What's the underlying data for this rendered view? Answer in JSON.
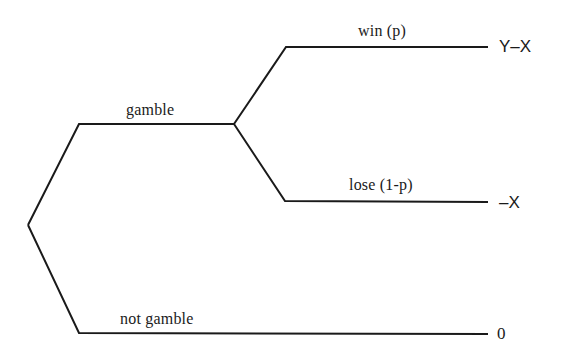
{
  "diagram": {
    "type": "decision-tree",
    "line_color": "#1a1a1a",
    "background": "#ffffff",
    "nodes": {
      "decision": {
        "x": 28,
        "y": 225
      },
      "chance": {
        "x": 234,
        "y": 125
      }
    },
    "branches": [
      {
        "id": "gamble",
        "label": "gamble",
        "from": "decision",
        "to": "chance"
      },
      {
        "id": "win",
        "label": "win (p)",
        "from": "chance",
        "payoff": "Y–X"
      },
      {
        "id": "lose",
        "label": "lose (1-p)",
        "from": "chance",
        "payoff": "–X"
      },
      {
        "id": "not-gamble",
        "label": "not gamble",
        "from": "decision",
        "payoff": "0"
      }
    ]
  }
}
